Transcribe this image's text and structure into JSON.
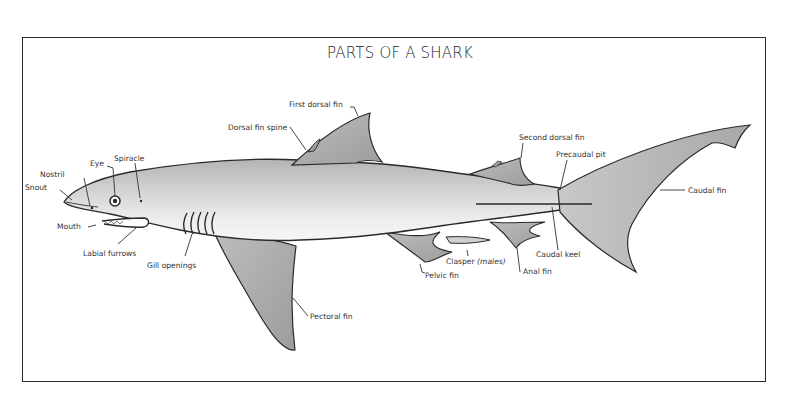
{
  "title": "PARTS OF A SHARK",
  "colors": {
    "outline": "#2a2a2a",
    "body_light": "#e4e4e4",
    "body_dark": "#b0b0b0",
    "fin": "#a9a9a9",
    "label": "#333333"
  },
  "labels": {
    "snout": "Snout",
    "nostril": "Nostril",
    "eye": "Eye",
    "spiracle": "Spiracle",
    "mouth": "Mouth",
    "labial_furrows": "Labial furrows",
    "gill_openings": "Gill openings",
    "dorsal_fin_spine": "Dorsal fin spine",
    "first_dorsal_fin": "First dorsal fin",
    "second_dorsal_fin": "Second dorsal fin",
    "precaudal_pit": "Precaudal pit",
    "caudal_fin": "Caudal fin",
    "caudal_keel": "Caudal keel",
    "clasper": "Clasper",
    "clasper_note": "(males)",
    "anal_fin": "Anal fin",
    "pelvic_fin": "Pelvic fin",
    "pectoral_fin": "Pectoral fin"
  }
}
